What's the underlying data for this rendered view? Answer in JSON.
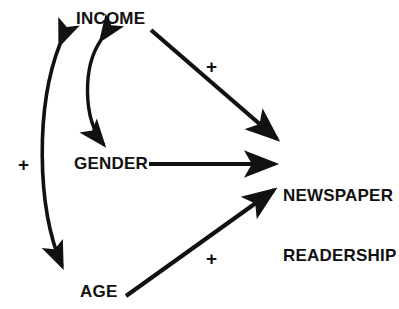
{
  "diagram": {
    "background_color": "#ffffff",
    "stroke_color": "#111111",
    "nodes": [
      {
        "id": "income",
        "label": "INCOME",
        "x": 76,
        "y": 10
      },
      {
        "id": "gender",
        "label": "GENDER",
        "x": 74,
        "y": 155
      },
      {
        "id": "age",
        "label": "AGE",
        "x": 80,
        "y": 283
      },
      {
        "id": "readership",
        "label_line1": "NEWSPAPER",
        "label_line2": "READERSHIP",
        "x": 283,
        "y": 147
      }
    ],
    "edges": [
      {
        "id": "income-to-readership",
        "from": "INCOME",
        "to": "NEWSPAPER READERSHIP",
        "type": "straight",
        "arrow": "single",
        "sign": "+"
      },
      {
        "id": "gender-to-readership",
        "from": "GENDER",
        "to": "NEWSPAPER READERSHIP",
        "type": "straight",
        "arrow": "single",
        "sign": ""
      },
      {
        "id": "age-to-readership",
        "from": "AGE",
        "to": "NEWSPAPER READERSHIP",
        "type": "straight",
        "arrow": "single",
        "sign": "+"
      },
      {
        "id": "income-gender-curve",
        "from": "INCOME",
        "to": "GENDER",
        "type": "curved",
        "arrow": "double",
        "sign": ""
      },
      {
        "id": "income-age-curve",
        "from": "INCOME",
        "to": "AGE",
        "type": "curved",
        "arrow": "double",
        "sign": "+"
      }
    ],
    "signs": [
      {
        "id": "sign-income-readership",
        "text": "+",
        "x": 206,
        "y": 57
      },
      {
        "id": "sign-income-age",
        "text": "+",
        "x": 18,
        "y": 155
      },
      {
        "id": "sign-age-readership",
        "text": "+",
        "x": 206,
        "y": 249
      }
    ]
  }
}
